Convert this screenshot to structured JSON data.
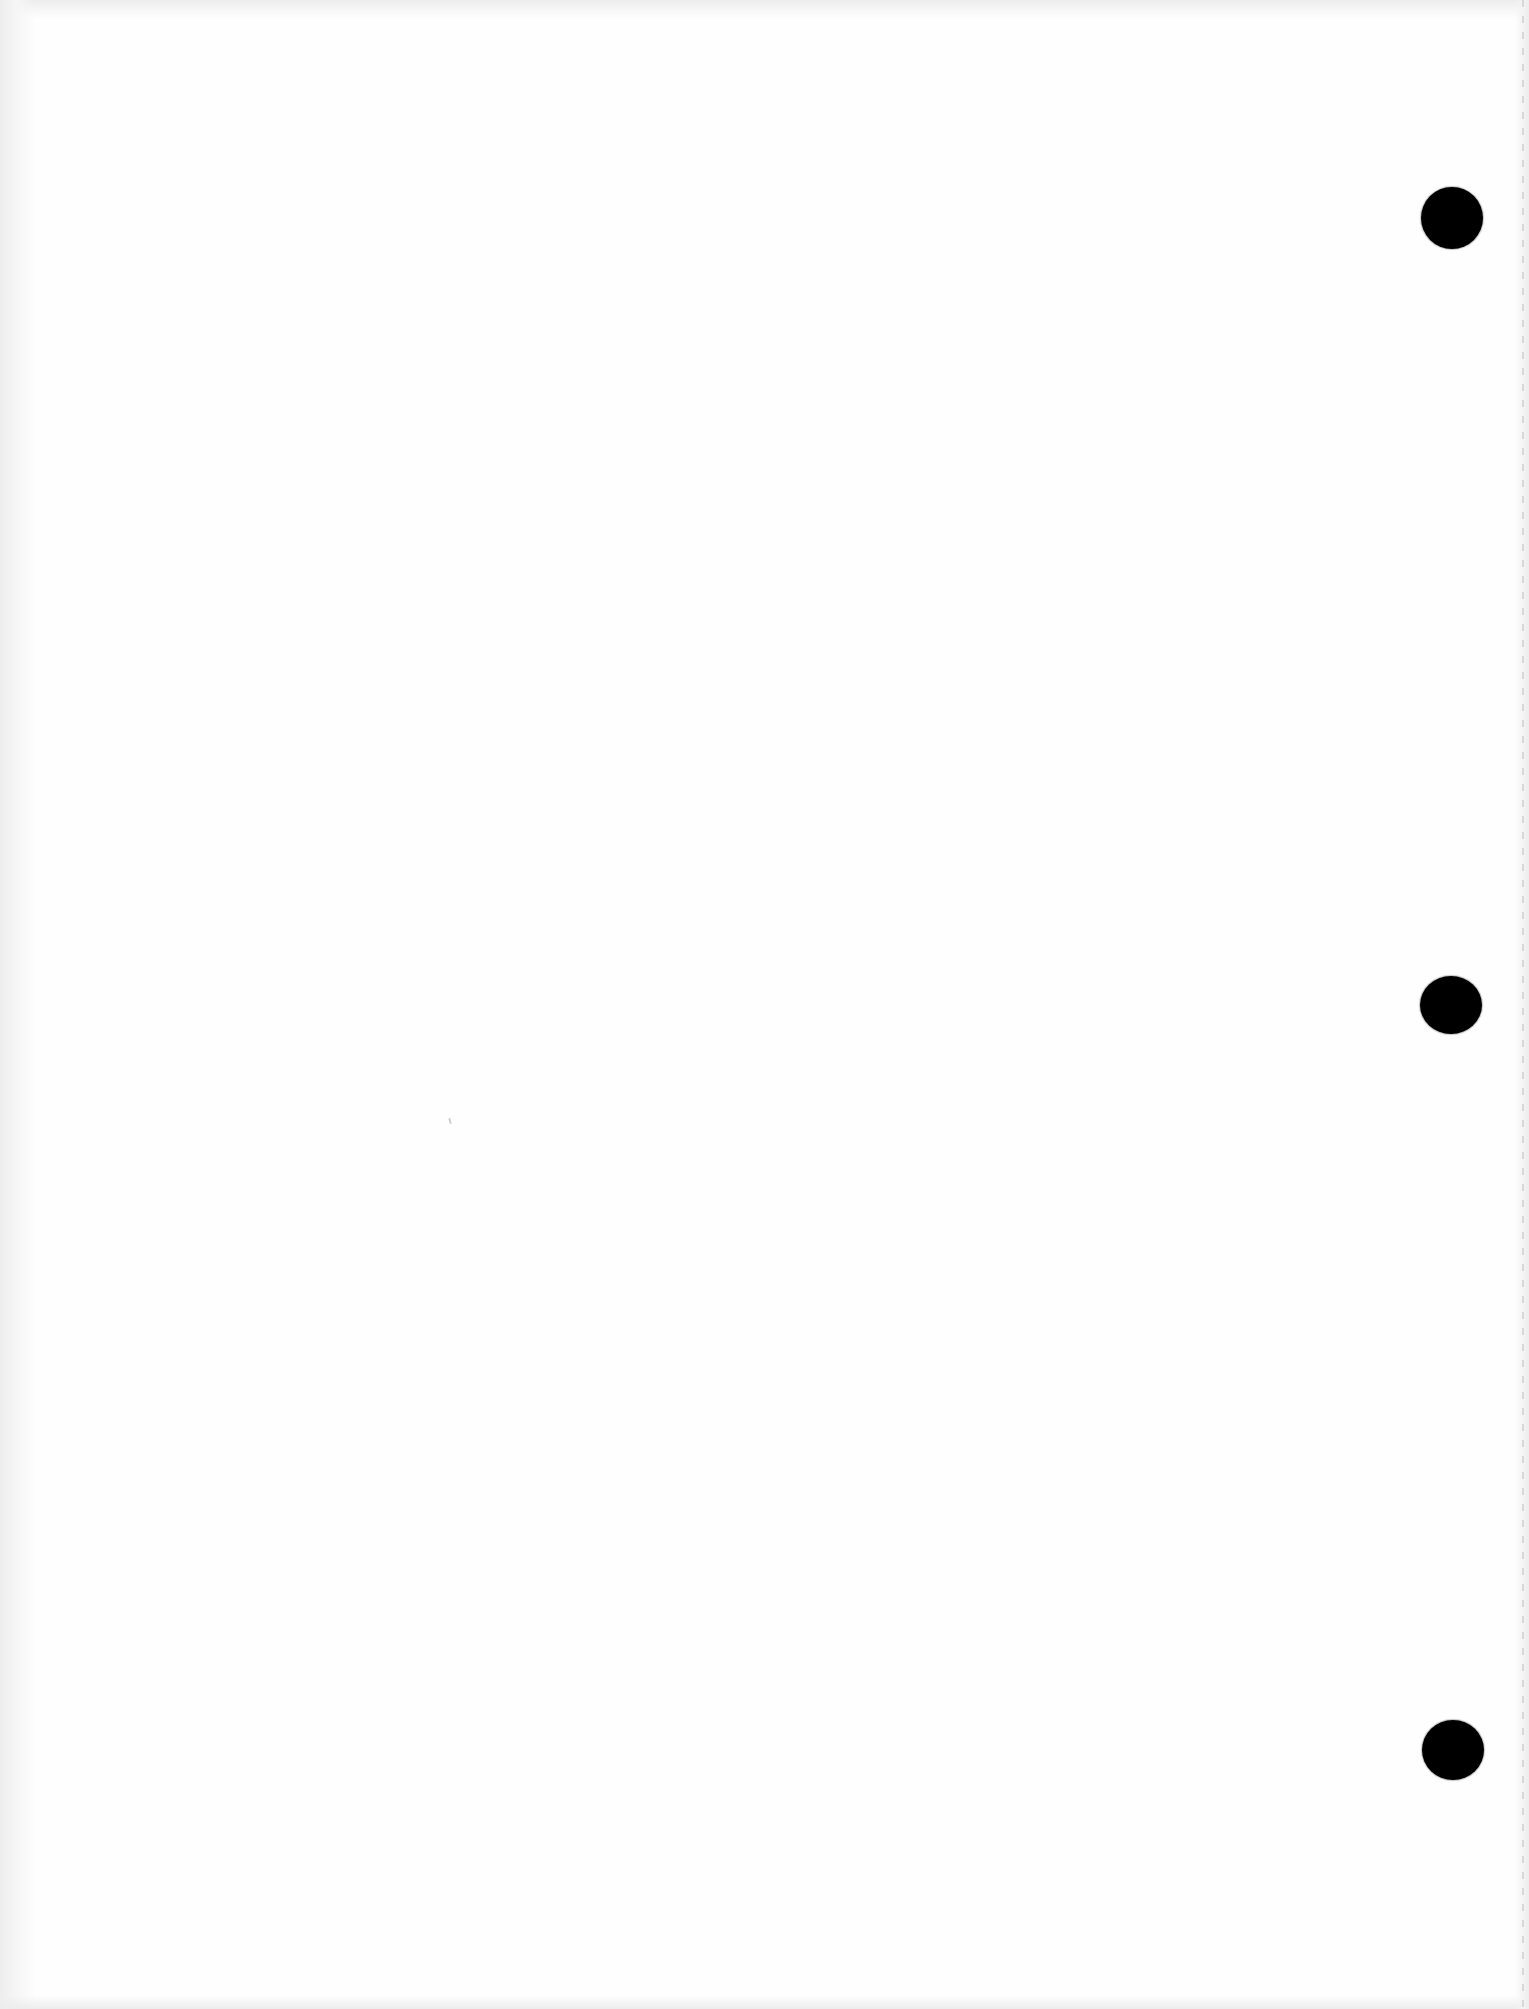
{
  "document": {
    "type": "blank-hole-punched-sheet",
    "background_color": "#fefefe",
    "text_content": []
  },
  "holes": [
    {
      "name": "hole-top",
      "cx": 1452,
      "cy": 218,
      "rx": 31,
      "ry": 31,
      "color": "#000000"
    },
    {
      "name": "hole-middle",
      "cx": 1451,
      "cy": 1005,
      "rx": 31,
      "ry": 29,
      "color": "#000000"
    },
    {
      "name": "hole-bottom",
      "cx": 1453,
      "cy": 1750,
      "rx": 31,
      "ry": 30,
      "color": "#000000"
    }
  ],
  "perforation": {
    "side": "right",
    "color": "#d4d4d4"
  },
  "marks": [
    {
      "name": "speck",
      "x": 449,
      "y": 1118
    }
  ]
}
